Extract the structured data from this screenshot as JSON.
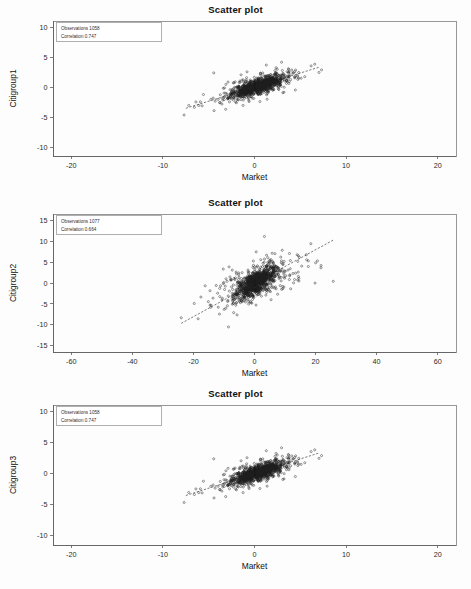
{
  "page": {
    "background": "#fdfdfd",
    "width": 471,
    "height": 589,
    "point_color": "#1c1c1c",
    "axis_color": "#5a5a5a",
    "frame_color": "#7d7d7d"
  },
  "chart_data": [
    {
      "type": "scatter",
      "title": "Scatter plot",
      "xlabel": "Market",
      "ylabel": "Citigroup1",
      "xlim": [
        -22,
        22
      ],
      "ylim": [
        -11.5,
        11
      ],
      "xticks": [
        -20,
        -10,
        0,
        10,
        20
      ],
      "yticks": [
        10,
        5,
        0,
        -5,
        -10
      ],
      "grid": false,
      "legend_position": "top-left",
      "annotations": [
        {
          "label": "Observations",
          "value": "1058",
          "text": "Observations 1058"
        },
        {
          "label": "Correlation",
          "value": "0.747",
          "text": "Correlation 0.747"
        }
      ],
      "observations": 1058,
      "correlation": 0.747,
      "distribution": {
        "n_core": 900,
        "n_tail": 158,
        "x_mean": 0.35,
        "x_sd": 1.45,
        "y_mean": 0.15,
        "y_sd": 0.95,
        "tail_x_sd": 3.0,
        "tail_y_sd": 1.7,
        "slope": 0.47,
        "intercept": -0.02,
        "seed": 11
      },
      "fit": {
        "x0": -7.5,
        "x1": 7.0,
        "slope": 0.47,
        "intercept": -0.02
      },
      "geom": {
        "left": 53,
        "top": 21,
        "right": 456,
        "bottom": 156,
        "title_y": 4
      }
    },
    {
      "type": "scatter",
      "title": "Scatter plot",
      "xlabel": "Market",
      "ylabel": "Citigroup2",
      "xlim": [
        -66,
        66
      ],
      "ylim": [
        -16.5,
        16.5
      ],
      "xticks": [
        -60,
        -40,
        -20,
        0,
        20,
        40,
        60
      ],
      "yticks": [
        15,
        10,
        5,
        0,
        -5,
        -10,
        -15
      ],
      "grid": false,
      "legend_position": "top-left",
      "annotations": [
        {
          "label": "Observations",
          "value": "1077",
          "text": "Observations 1077"
        },
        {
          "label": "Correlation",
          "value": "0.664",
          "text": "Correlation 0.664"
        }
      ],
      "observations": 1077,
      "correlation": 0.664,
      "distribution": {
        "n_core": 840,
        "n_tail": 237,
        "x_mean": 0.4,
        "x_sd": 3.4,
        "y_mean": 0.1,
        "y_sd": 1.9,
        "tail_x_sd": 9.0,
        "tail_y_sd": 3.4,
        "slope": 0.4,
        "intercept": -0.05,
        "seed": 29
      },
      "fit": {
        "x0": -24,
        "x1": 26,
        "slope": 0.4,
        "intercept": -0.05
      },
      "geom": {
        "left": 53,
        "top": 214,
        "right": 456,
        "bottom": 352,
        "title_y": 197
      }
    },
    {
      "type": "scatter",
      "title": "Scatter plot",
      "xlabel": "Market",
      "ylabel": "Citigroup3",
      "xlim": [
        -22,
        22
      ],
      "ylim": [
        -11.5,
        11
      ],
      "xticks": [
        -20,
        -10,
        0,
        10,
        20
      ],
      "yticks": [
        10,
        5,
        0,
        -5,
        -10
      ],
      "grid": false,
      "legend_position": "top-left",
      "annotations": [
        {
          "label": "Observations",
          "value": "1058",
          "text": "Observations 1058"
        },
        {
          "label": "Correlation",
          "value": "0.747",
          "text": "Correlation 0.747"
        }
      ],
      "observations": 1058,
      "correlation": 0.747,
      "distribution": {
        "n_core": 900,
        "n_tail": 158,
        "x_mean": 0.35,
        "x_sd": 1.45,
        "y_mean": 0.15,
        "y_sd": 0.95,
        "tail_x_sd": 3.0,
        "tail_y_sd": 1.7,
        "slope": 0.47,
        "intercept": -0.02,
        "seed": 11
      },
      "fit": {
        "x0": -7.5,
        "x1": 7.0,
        "slope": 0.47,
        "intercept": -0.02
      },
      "geom": {
        "left": 53,
        "top": 405,
        "right": 456,
        "bottom": 545,
        "title_y": 388
      }
    }
  ]
}
